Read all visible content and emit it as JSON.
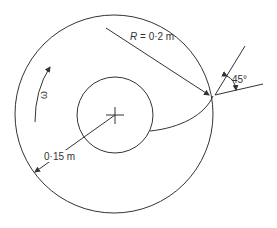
{
  "diagram": {
    "type": "cam-profile",
    "labels": {
      "outer_radius": "R = 0·2 m",
      "outer_radius_symbol": "R",
      "outer_radius_value": " = 0·2 m",
      "angle": "45°",
      "angular_velocity": "ω",
      "inner_dim": "0·15 m"
    },
    "geometry": {
      "outer_circle": {
        "cx": 114,
        "cy": 114,
        "r": 99
      },
      "inner_circle": {
        "cx": 114,
        "cy": 115,
        "r": 38
      },
      "center_mark": {
        "x": 114,
        "y": 115
      }
    },
    "colors": {
      "stroke": "#333333",
      "background": "#ffffff"
    }
  }
}
